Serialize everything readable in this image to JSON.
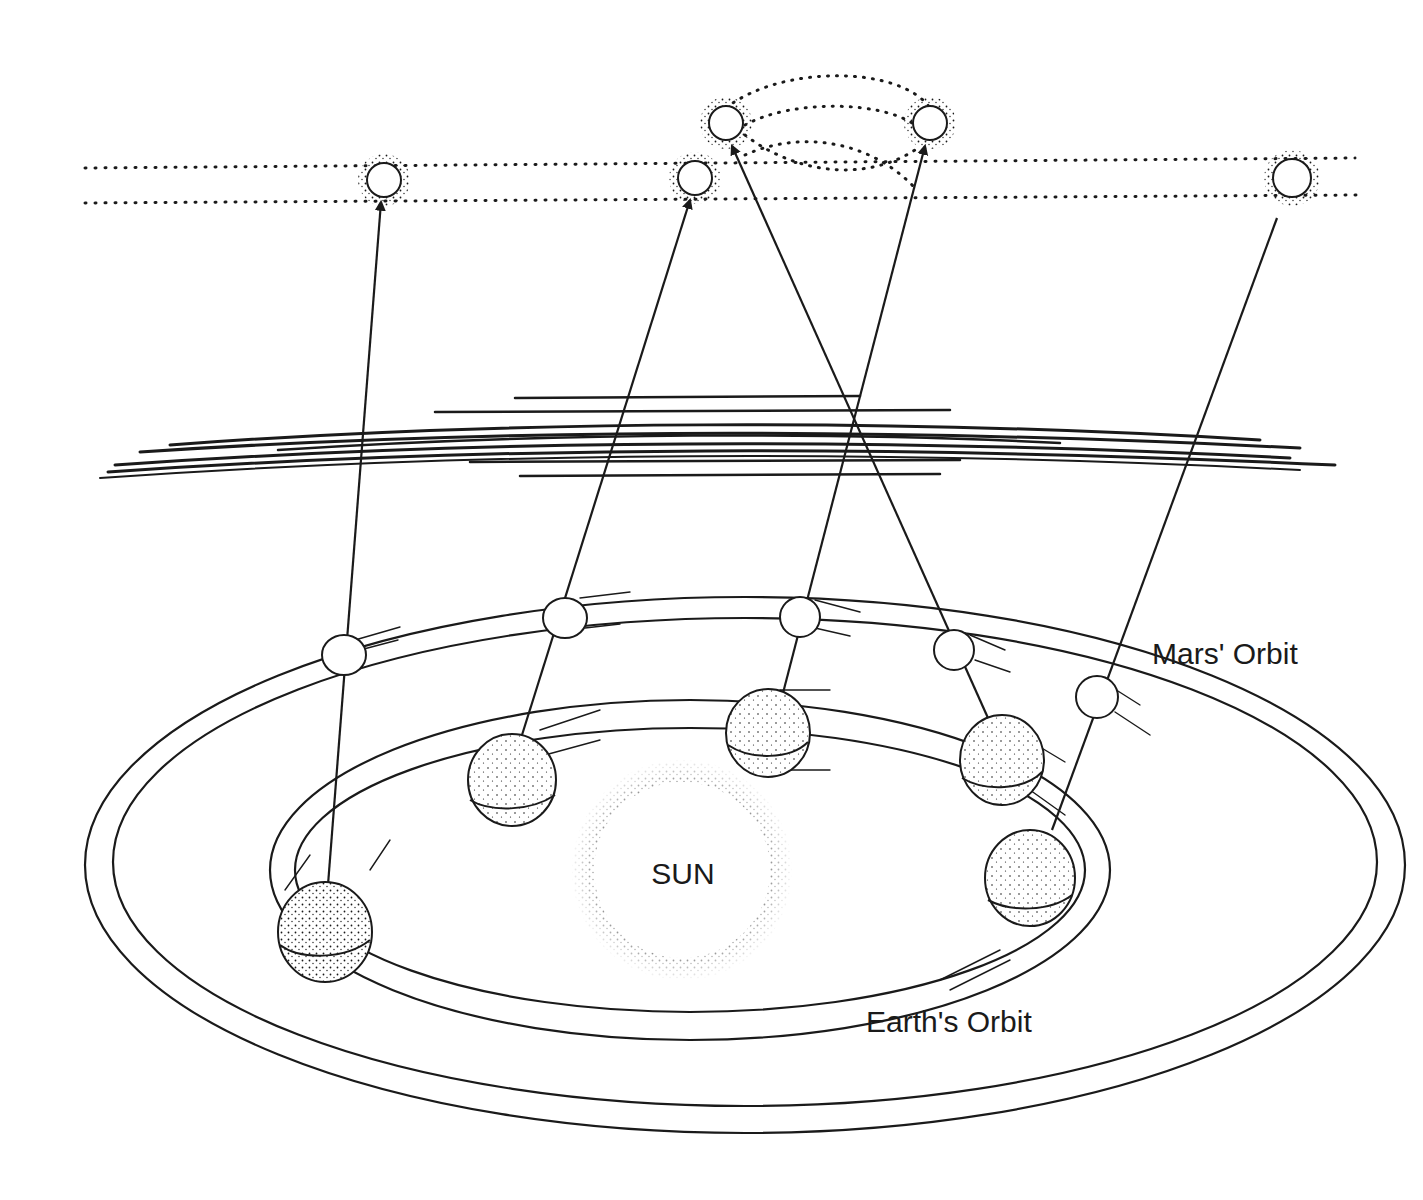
{
  "diagram": {
    "labels": {
      "sun": "SUN",
      "mars_orbit": "Mars' Orbit",
      "earth_orbit": "Earth's Orbit"
    },
    "colors": {
      "ink": "#1a1a1a",
      "background": "#ffffff"
    },
    "sky_positions": [
      {
        "id": 1,
        "x": 384,
        "y": 180
      },
      {
        "id": 2,
        "x": 695,
        "y": 178
      },
      {
        "id": 3,
        "x": 726,
        "y": 123
      },
      {
        "id": 4,
        "x": 930,
        "y": 123
      },
      {
        "id": 5,
        "x": 1292,
        "y": 178
      }
    ],
    "mars_positions": [
      {
        "id": 1,
        "x": 344,
        "y": 655
      },
      {
        "id": 2,
        "x": 565,
        "y": 618
      },
      {
        "id": 3,
        "x": 800,
        "y": 617
      },
      {
        "id": 4,
        "x": 954,
        "y": 650
      },
      {
        "id": 5,
        "x": 1097,
        "y": 697
      }
    ],
    "earth_positions": [
      {
        "id": 1,
        "x": 325,
        "y": 932
      },
      {
        "id": 2,
        "x": 512,
        "y": 780
      },
      {
        "id": 3,
        "x": 768,
        "y": 733
      },
      {
        "id": 4,
        "x": 1002,
        "y": 760
      },
      {
        "id": 5,
        "x": 1030,
        "y": 878
      }
    ]
  }
}
